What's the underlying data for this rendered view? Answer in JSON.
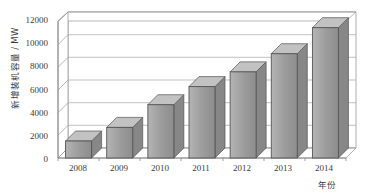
{
  "chart_data": {
    "type": "bar",
    "title": "",
    "xlabel": "年份",
    "ylabel": "新增装机容量 / MW",
    "categories": [
      "2008",
      "2009",
      "2010",
      "2011",
      "2012",
      "2013",
      "2014"
    ],
    "values": [
      1500,
      2700,
      4700,
      6300,
      7600,
      9200,
      11500
    ],
    "ylim": [
      0,
      12000
    ],
    "yticks": [
      0,
      2000,
      4000,
      6000,
      8000,
      10000,
      12000
    ],
    "ytick_labels": [
      "0",
      "2000",
      "4000",
      "6000",
      "8000",
      "10000",
      "12000"
    ],
    "grid": true,
    "legend": "none",
    "projection": "3d-perspective",
    "series": [
      {
        "name": "新增装机容量",
        "values": [
          1500,
          2700,
          4700,
          6300,
          7600,
          9200,
          11500
        ]
      }
    ],
    "colors": {
      "bar_fill": "#9b9b9b",
      "bar_fill_light": "#b4b4b4",
      "bar_outline": "#555555",
      "gridline": "#a8a8a8",
      "axis": "#8c8c8c",
      "background": "#ffffff",
      "text": "#3a3a3a"
    }
  }
}
